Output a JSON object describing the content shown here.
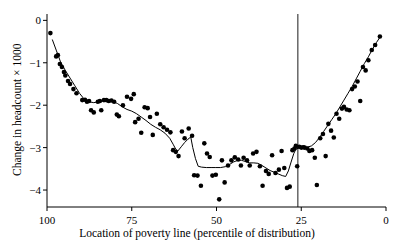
{
  "chart_data": {
    "type": "scatter",
    "title": "",
    "xlabel": "Location of poverty line (percentile of distribution)",
    "ylabel": "Change in headcount × 1000",
    "xlim": [
      100,
      0
    ],
    "ylim": [
      -4.4,
      0.15
    ],
    "x_ticks": [
      100,
      75,
      50,
      25,
      0
    ],
    "x_tick_labels": [
      "100",
      "75",
      "50",
      "25",
      "0"
    ],
    "y_ticks": [
      0,
      -1,
      -2,
      -3,
      -4
    ],
    "y_tick_labels": [
      "0",
      "−1",
      "−2",
      "−3",
      "−4"
    ],
    "grid": false,
    "legend": false,
    "axis_style": "left-and-bottom-spines",
    "annotations": [
      {
        "name": "vertical-reference-line",
        "type": "vline",
        "x": 26,
        "label": ""
      }
    ],
    "series": [
      {
        "name": "observations",
        "type": "scatter",
        "marker": "filled-circle",
        "marker_size": 2.3,
        "color": "#000000",
        "points": [
          [
            99.0,
            -0.3
          ],
          [
            97.3,
            -0.85
          ],
          [
            96.8,
            -0.82
          ],
          [
            96.2,
            -1.03
          ],
          [
            95.6,
            -1.1
          ],
          [
            95.0,
            -1.22
          ],
          [
            94.6,
            -1.3
          ],
          [
            93.8,
            -1.43
          ],
          [
            93.2,
            -1.5
          ],
          [
            92.2,
            -1.62
          ],
          [
            91.3,
            -1.72
          ],
          [
            89.6,
            -1.88
          ],
          [
            88.8,
            -1.87
          ],
          [
            88.2,
            -1.92
          ],
          [
            87.6,
            -1.9
          ],
          [
            87.0,
            -2.12
          ],
          [
            86.2,
            -2.17
          ],
          [
            85.0,
            -1.92
          ],
          [
            84.4,
            -1.9
          ],
          [
            84.0,
            -2.12
          ],
          [
            83.2,
            -1.88
          ],
          [
            82.5,
            -1.88
          ],
          [
            81.8,
            -1.9
          ],
          [
            81.0,
            -1.89
          ],
          [
            80.2,
            -1.92
          ],
          [
            79.4,
            -2.22
          ],
          [
            78.8,
            -2.26
          ],
          [
            77.6,
            -2.0
          ],
          [
            76.4,
            -1.8
          ],
          [
            75.2,
            -1.85
          ],
          [
            74.4,
            -1.74
          ],
          [
            74.0,
            -2.4
          ],
          [
            73.0,
            -2.32
          ],
          [
            72.2,
            -2.65
          ],
          [
            71.2,
            -2.05
          ],
          [
            70.3,
            -2.07
          ],
          [
            69.6,
            -2.28
          ],
          [
            68.8,
            -2.7
          ],
          [
            67.6,
            -2.2
          ],
          [
            66.6,
            -2.45
          ],
          [
            65.6,
            -2.52
          ],
          [
            64.6,
            -2.58
          ],
          [
            63.6,
            -2.64
          ],
          [
            62.8,
            -3.06
          ],
          [
            62.0,
            -3.1
          ],
          [
            61.2,
            -3.2
          ],
          [
            60.2,
            -2.62
          ],
          [
            59.4,
            -2.78
          ],
          [
            58.2,
            -2.55
          ],
          [
            57.2,
            -2.72
          ],
          [
            56.6,
            -3.65
          ],
          [
            55.6,
            -3.66
          ],
          [
            54.6,
            -3.9
          ],
          [
            53.6,
            -2.9
          ],
          [
            52.8,
            -3.14
          ],
          [
            52.0,
            -3.22
          ],
          [
            51.2,
            -3.66
          ],
          [
            50.2,
            -3.64
          ],
          [
            49.2,
            -4.22
          ],
          [
            48.4,
            -3.3
          ],
          [
            47.6,
            -3.82
          ],
          [
            46.6,
            -3.42
          ],
          [
            45.6,
            -3.3
          ],
          [
            44.6,
            -3.23
          ],
          [
            43.6,
            -3.28
          ],
          [
            42.8,
            -3.42
          ],
          [
            42.0,
            -3.24
          ],
          [
            41.0,
            -3.3
          ],
          [
            40.2,
            -3.42
          ],
          [
            39.2,
            -3.14
          ],
          [
            38.2,
            -3.1
          ],
          [
            37.2,
            -3.44
          ],
          [
            36.4,
            -3.9
          ],
          [
            35.4,
            -3.55
          ],
          [
            34.6,
            -3.62
          ],
          [
            33.6,
            -3.18
          ],
          [
            32.6,
            -3.6
          ],
          [
            31.6,
            -3.52
          ],
          [
            30.8,
            -3.08
          ],
          [
            30.0,
            -3.48
          ],
          [
            29.2,
            -3.95
          ],
          [
            28.4,
            -3.92
          ],
          [
            27.6,
            -3.06
          ],
          [
            27.0,
            -3.02
          ],
          [
            26.6,
            -2.96
          ],
          [
            26.2,
            -3.44
          ],
          [
            25.6,
            -2.98
          ],
          [
            25.0,
            -3.0
          ],
          [
            24.4,
            -2.99
          ],
          [
            24.0,
            -3.0
          ],
          [
            23.2,
            -3.02
          ],
          [
            22.6,
            -3.08
          ],
          [
            21.8,
            -3.06
          ],
          [
            21.0,
            -3.24
          ],
          [
            20.4,
            -3.88
          ],
          [
            19.4,
            -2.78
          ],
          [
            18.6,
            -2.68
          ],
          [
            17.8,
            -3.2
          ],
          [
            17.0,
            -2.44
          ],
          [
            16.2,
            -2.6
          ],
          [
            15.4,
            -2.76
          ],
          [
            14.6,
            -2.2
          ],
          [
            13.8,
            -2.32
          ],
          [
            13.0,
            -2.08
          ],
          [
            12.4,
            -2.04
          ],
          [
            11.6,
            -2.1
          ],
          [
            10.8,
            -2.12
          ],
          [
            10.0,
            -1.62
          ],
          [
            9.2,
            -1.56
          ],
          [
            8.4,
            -1.44
          ],
          [
            7.6,
            -1.9
          ],
          [
            6.8,
            -1.1
          ],
          [
            6.0,
            -1.18
          ],
          [
            5.2,
            -0.94
          ],
          [
            4.2,
            -0.7
          ],
          [
            3.2,
            -0.58
          ],
          [
            1.8,
            -0.38
          ]
        ]
      },
      {
        "name": "fitted-curve",
        "type": "line",
        "color": "#000000",
        "width": 1,
        "points": [
          [
            98.4,
            -0.46
          ],
          [
            97.2,
            -0.72
          ],
          [
            96.0,
            -0.98
          ],
          [
            94.6,
            -1.18
          ],
          [
            93.2,
            -1.36
          ],
          [
            91.8,
            -1.54
          ],
          [
            90.4,
            -1.72
          ],
          [
            89.0,
            -1.86
          ],
          [
            87.6,
            -1.92
          ],
          [
            86.2,
            -1.94
          ],
          [
            84.8,
            -1.92
          ],
          [
            83.4,
            -1.9
          ],
          [
            82.0,
            -1.9
          ],
          [
            80.6,
            -1.91
          ],
          [
            79.2,
            -1.96
          ],
          [
            77.8,
            -2.04
          ],
          [
            76.4,
            -2.1
          ],
          [
            75.0,
            -2.14
          ],
          [
            73.6,
            -2.2
          ],
          [
            72.2,
            -2.28
          ],
          [
            70.8,
            -2.36
          ],
          [
            69.4,
            -2.45
          ],
          [
            68.0,
            -2.52
          ],
          [
            66.6,
            -2.58
          ],
          [
            65.2,
            -2.66
          ],
          [
            63.8,
            -2.78
          ],
          [
            62.8,
            -2.92
          ],
          [
            62.0,
            -3.04
          ],
          [
            61.4,
            -3.08
          ],
          [
            60.4,
            -2.98
          ],
          [
            59.4,
            -2.88
          ],
          [
            58.4,
            -2.8
          ],
          [
            57.6,
            -2.75
          ],
          [
            57.0,
            -3.0
          ],
          [
            56.2,
            -3.26
          ],
          [
            55.4,
            -3.44
          ],
          [
            54.4,
            -3.46
          ],
          [
            53.0,
            -3.47
          ],
          [
            51.6,
            -3.47
          ],
          [
            50.2,
            -3.47
          ],
          [
            48.8,
            -3.47
          ],
          [
            47.4,
            -3.45
          ],
          [
            46.2,
            -3.4
          ],
          [
            45.0,
            -3.34
          ],
          [
            43.8,
            -3.3
          ],
          [
            42.6,
            -3.3
          ],
          [
            41.4,
            -3.33
          ],
          [
            40.2,
            -3.36
          ],
          [
            39.0,
            -3.36
          ],
          [
            37.8,
            -3.37
          ],
          [
            36.6,
            -3.42
          ],
          [
            35.4,
            -3.48
          ],
          [
            34.2,
            -3.54
          ],
          [
            33.0,
            -3.58
          ],
          [
            31.8,
            -3.62
          ],
          [
            30.6,
            -3.66
          ],
          [
            29.6,
            -3.68
          ],
          [
            28.8,
            -3.55
          ],
          [
            28.0,
            -3.34
          ],
          [
            27.2,
            -3.14
          ],
          [
            26.6,
            -3.04
          ],
          [
            25.6,
            -3.0
          ],
          [
            24.4,
            -2.99
          ],
          [
            23.2,
            -2.99
          ],
          [
            22.0,
            -2.96
          ],
          [
            20.8,
            -2.88
          ],
          [
            19.6,
            -2.76
          ],
          [
            18.4,
            -2.62
          ],
          [
            17.2,
            -2.48
          ],
          [
            16.0,
            -2.34
          ],
          [
            14.8,
            -2.2
          ],
          [
            13.6,
            -2.04
          ],
          [
            12.4,
            -1.88
          ],
          [
            11.2,
            -1.72
          ],
          [
            10.0,
            -1.56
          ],
          [
            8.8,
            -1.38
          ],
          [
            7.6,
            -1.2
          ],
          [
            6.4,
            -1.02
          ],
          [
            5.2,
            -0.86
          ],
          [
            4.0,
            -0.68
          ],
          [
            2.8,
            -0.52
          ],
          [
            1.8,
            -0.4
          ]
        ]
      }
    ]
  }
}
